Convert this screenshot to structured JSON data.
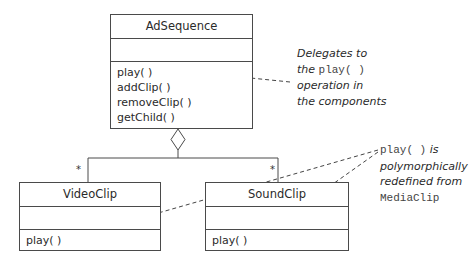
{
  "diagram": {
    "type": "UML class diagram (Composite pattern)",
    "classes": [
      {
        "id": "adsequence",
        "name": "AdSequence",
        "attributes": [],
        "operations": [
          "play( )",
          "addClip( )",
          "removeClip( )",
          "getChild( )"
        ]
      },
      {
        "id": "videoclip",
        "name": "VideoClip",
        "attributes": [],
        "operations": [
          "play( )"
        ]
      },
      {
        "id": "soundclip",
        "name": "SoundClip",
        "attributes": [],
        "operations": [
          "play( )"
        ]
      }
    ],
    "relationships": [
      {
        "type": "aggregation",
        "whole": "AdSequence",
        "parts": [
          "VideoClip",
          "SoundClip"
        ],
        "multiplicity": "*"
      }
    ],
    "notes": [
      {
        "id": "delegates-note",
        "lines": [
          {
            "text": "Delegates to"
          },
          {
            "prefix": "the ",
            "code": "play( )"
          },
          {
            "text": "operation in"
          },
          {
            "text": "the components"
          }
        ],
        "points_to": "AdSequence.play( )"
      },
      {
        "id": "polymorphic-note",
        "lines": [
          {
            "code": "play( )",
            "suffix": " is"
          },
          {
            "text": "polymorphically"
          },
          {
            "text": "redefined from"
          },
          {
            "code": "MediaClip"
          }
        ],
        "points_to": [
          "VideoClip.play( )",
          "SoundClip.play( )"
        ]
      }
    ],
    "multiplicity_left": "*",
    "multiplicity_right": "*"
  }
}
